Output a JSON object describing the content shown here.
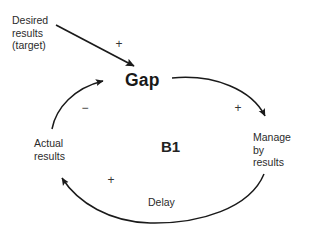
{
  "diagram": {
    "type": "causal-loop-diagram",
    "title": "",
    "loop_identifier": "B1",
    "loop_kind": "balancing",
    "background_color": "#ffffff",
    "line_color": "#1a1a1a",
    "text_color": "#2b2b2b",
    "nodes": [
      {
        "id": "desired_results",
        "label": "Desired\nresults\n(target)",
        "x": 12,
        "y": 14
      },
      {
        "id": "gap",
        "label": "Gap",
        "x": 125,
        "y": 70
      },
      {
        "id": "manage_by_results",
        "label": "Manage\nby\nresults",
        "x": 253,
        "y": 131
      },
      {
        "id": "actual_results",
        "label": "Actual\nresults",
        "x": 34,
        "y": 137
      }
    ],
    "center_label": "B1",
    "delay_label": "Delay",
    "links": [
      {
        "id": "desired-to-gap",
        "from": "desired_results",
        "to": "gap",
        "polarity": "+"
      },
      {
        "id": "gap-to-manage",
        "from": "gap",
        "to": "manage_by_results",
        "polarity": "+"
      },
      {
        "id": "manage-to-actual",
        "from": "manage_by_results",
        "to": "actual_results",
        "polarity": "+",
        "delay": "Delay"
      },
      {
        "id": "actual-to-gap",
        "from": "actual_results",
        "to": "gap",
        "polarity": "-"
      }
    ],
    "polarity_marks": [
      {
        "id": "plus-desired-gap",
        "symbol": "+",
        "x": 113,
        "y": 38
      },
      {
        "id": "minus-actual-gap",
        "symbol": "−",
        "x": 79,
        "y": 102
      },
      {
        "id": "plus-gap-manage",
        "symbol": "+",
        "x": 232,
        "y": 102
      },
      {
        "id": "plus-manage-actual",
        "symbol": "+",
        "x": 105,
        "y": 174
      }
    ]
  }
}
